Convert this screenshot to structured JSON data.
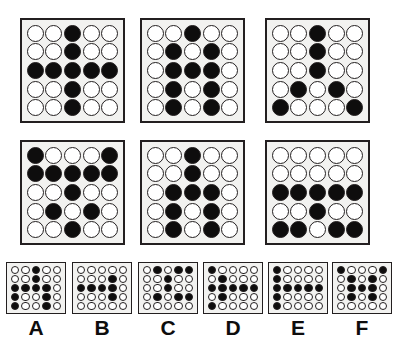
{
  "puzzle": {
    "title": "Matrix reasoning puzzle",
    "grid_rows": 5,
    "grid_cols": 5,
    "legend": {
      "filled": "black circle",
      "empty": "white circle"
    },
    "matrix": {
      "rows": 2,
      "cols": 3,
      "cells": [
        {
          "id": "cell-1",
          "position": "row1-col1",
          "pattern": [
            [
              0,
              0,
              1,
              0,
              0
            ],
            [
              0,
              0,
              1,
              0,
              0
            ],
            [
              1,
              1,
              1,
              1,
              1
            ],
            [
              0,
              0,
              1,
              0,
              0
            ],
            [
              0,
              0,
              1,
              0,
              0
            ]
          ]
        },
        {
          "id": "cell-2",
          "position": "row1-col2",
          "pattern": [
            [
              0,
              0,
              1,
              0,
              0
            ],
            [
              0,
              1,
              0,
              1,
              0
            ],
            [
              0,
              1,
              1,
              1,
              0
            ],
            [
              0,
              1,
              0,
              1,
              0
            ],
            [
              0,
              1,
              0,
              1,
              0
            ]
          ]
        },
        {
          "id": "cell-3",
          "position": "row1-col3",
          "pattern": [
            [
              0,
              0,
              1,
              0,
              0
            ],
            [
              0,
              0,
              1,
              0,
              0
            ],
            [
              0,
              0,
              1,
              0,
              0
            ],
            [
              0,
              1,
              0,
              1,
              0
            ],
            [
              1,
              0,
              0,
              0,
              1
            ]
          ]
        },
        {
          "id": "cell-4",
          "position": "row2-col1",
          "pattern": [
            [
              1,
              0,
              0,
              0,
              1
            ],
            [
              1,
              1,
              1,
              1,
              1
            ],
            [
              0,
              0,
              1,
              0,
              0
            ],
            [
              0,
              1,
              0,
              1,
              0
            ],
            [
              0,
              0,
              1,
              0,
              0
            ]
          ]
        },
        {
          "id": "cell-5",
          "position": "row2-col2",
          "pattern": [
            [
              0,
              0,
              1,
              0,
              0
            ],
            [
              0,
              0,
              1,
              0,
              0
            ],
            [
              0,
              1,
              1,
              1,
              0
            ],
            [
              0,
              1,
              0,
              1,
              0
            ],
            [
              0,
              1,
              0,
              1,
              0
            ]
          ]
        },
        {
          "id": "cell-6",
          "position": "row2-col3",
          "pattern": [
            [
              0,
              0,
              0,
              0,
              0
            ],
            [
              0,
              0,
              0,
              0,
              0
            ],
            [
              1,
              1,
              1,
              1,
              1
            ],
            [
              0,
              0,
              1,
              0,
              0
            ],
            [
              1,
              1,
              0,
              1,
              1
            ]
          ]
        }
      ]
    },
    "options": [
      {
        "id": "option-a",
        "label": "A",
        "pattern": [
          [
            0,
            0,
            1,
            0,
            0
          ],
          [
            0,
            0,
            1,
            0,
            0
          ],
          [
            1,
            1,
            1,
            1,
            0
          ],
          [
            1,
            0,
            0,
            1,
            0
          ],
          [
            1,
            0,
            0,
            1,
            0
          ]
        ]
      },
      {
        "id": "option-b",
        "label": "B",
        "pattern": [
          [
            0,
            0,
            0,
            0,
            0
          ],
          [
            0,
            0,
            0,
            1,
            0
          ],
          [
            1,
            1,
            1,
            1,
            0
          ],
          [
            0,
            0,
            0,
            1,
            0
          ],
          [
            0,
            0,
            0,
            0,
            0
          ]
        ]
      },
      {
        "id": "option-c",
        "label": "C",
        "pattern": [
          [
            0,
            1,
            0,
            1,
            1
          ],
          [
            0,
            0,
            1,
            0,
            0
          ],
          [
            0,
            0,
            1,
            0,
            0
          ],
          [
            0,
            1,
            0,
            1,
            1
          ],
          [
            0,
            0,
            0,
            0,
            0
          ]
        ]
      },
      {
        "id": "option-d",
        "label": "D",
        "pattern": [
          [
            1,
            0,
            0,
            0,
            0
          ],
          [
            0,
            1,
            0,
            0,
            0
          ],
          [
            1,
            1,
            1,
            1,
            1
          ],
          [
            0,
            1,
            0,
            0,
            0
          ],
          [
            1,
            0,
            0,
            0,
            0
          ]
        ]
      },
      {
        "id": "option-e",
        "label": "E",
        "pattern": [
          [
            1,
            0,
            0,
            0,
            0
          ],
          [
            1,
            0,
            0,
            0,
            0
          ],
          [
            1,
            1,
            1,
            1,
            1
          ],
          [
            1,
            0,
            0,
            0,
            0
          ],
          [
            1,
            0,
            0,
            0,
            0
          ]
        ]
      },
      {
        "id": "option-f",
        "label": "F",
        "pattern": [
          [
            1,
            0,
            0,
            0,
            1
          ],
          [
            0,
            1,
            0,
            1,
            0
          ],
          [
            0,
            1,
            1,
            1,
            0
          ],
          [
            0,
            1,
            0,
            1,
            0
          ],
          [
            0,
            0,
            0,
            0,
            0
          ]
        ]
      }
    ],
    "colors": {
      "filled_dot": "#0e0d0d",
      "empty_dot": "#ffffff",
      "outline": "#231f20",
      "panel_background": "#f2f2f0",
      "page_background": "#ffffff"
    }
  }
}
